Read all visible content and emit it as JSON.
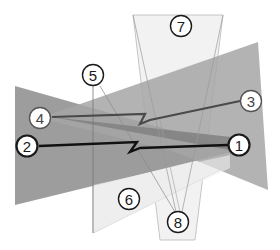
{
  "diagram": {
    "type": "overlapping-polygons-with-labeled-markers",
    "colors": {
      "background": "#ffffff",
      "dark_fill": "#8f8f8f",
      "medium_fill": "#a9a9a9",
      "light_fill": "#ededed",
      "very_light_fill": "#f3f3f3",
      "line_dark": "#1a1a1a",
      "line_mid": "#555555",
      "line_thin": "#9a9a9a"
    },
    "labels": [
      {
        "id": "1",
        "text": "1",
        "x": 239,
        "y": 145,
        "bold": true
      },
      {
        "id": "2",
        "text": "2",
        "x": 27,
        "y": 146,
        "bold": true
      },
      {
        "id": "3",
        "text": "3",
        "x": 251,
        "y": 101,
        "bold": false
      },
      {
        "id": "4",
        "text": "4",
        "x": 40,
        "y": 118,
        "bold": false
      },
      {
        "id": "5",
        "text": "5",
        "x": 93,
        "y": 75,
        "bold": false
      },
      {
        "id": "6",
        "text": "6",
        "x": 129,
        "y": 199,
        "bold": false
      },
      {
        "id": "7",
        "text": "7",
        "x": 181,
        "y": 26,
        "bold": false
      },
      {
        "id": "8",
        "text": "8",
        "x": 178,
        "y": 222,
        "bold": false
      }
    ]
  }
}
